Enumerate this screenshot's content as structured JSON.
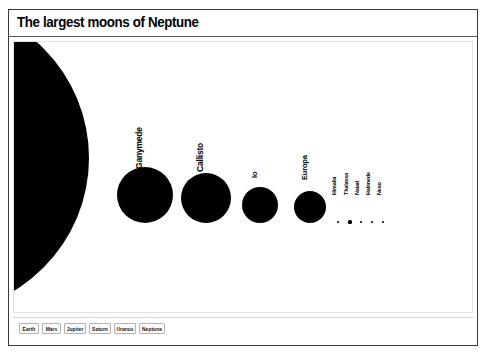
{
  "window": {
    "title": "The largest moons of Neptune"
  },
  "tabs": [
    {
      "label": "Earth",
      "x": 6,
      "w": 20
    },
    {
      "label": "Mars",
      "x": 29,
      "w": 19
    },
    {
      "label": "Jupiter",
      "x": 51,
      "w": 22
    },
    {
      "label": "Saturn",
      "x": 76,
      "w": 22
    },
    {
      "label": "Uranus",
      "x": 101,
      "w": 22
    },
    {
      "label": "Neptune",
      "x": 126,
      "w": 26
    }
  ],
  "chart_data": {
    "type": "scatter",
    "title": "The largest moons of Neptune",
    "xlabel": "",
    "ylabel": "",
    "grid": false,
    "legend": false,
    "baseline_y": 181,
    "encoding": "circle area scaled to body diameter",
    "categories": [
      "Neptune",
      "Ganymede",
      "Callisto",
      "Io",
      "Europa",
      "Himalia",
      "Thalassa",
      "Naiad",
      "Halimede",
      "Neso"
    ],
    "bodies": [
      {
        "name": "Neptune",
        "cx": -80,
        "cy": 116,
        "d": 310,
        "label": "",
        "label_x": 0,
        "label_y": 0,
        "fontsize": 0
      },
      {
        "name": "Ganymede",
        "cx": 131,
        "cy": 153,
        "d": 56,
        "label": "Ganymede",
        "label_x": 130,
        "label_y": 117,
        "fontsize": 8.5
      },
      {
        "name": "Callisto",
        "cx": 192,
        "cy": 156,
        "d": 50,
        "label": "Callisto",
        "label_x": 191,
        "label_y": 120,
        "fontsize": 8.5
      },
      {
        "name": "Io",
        "cx": 246,
        "cy": 163,
        "d": 36,
        "label": "Io",
        "label_x": 245,
        "label_y": 127,
        "fontsize": 7.5
      },
      {
        "name": "Europa",
        "cx": 296,
        "cy": 165,
        "d": 32,
        "label": "Europa",
        "label_x": 295,
        "label_y": 129,
        "fontsize": 7.5
      },
      {
        "name": "Himalia",
        "cx": 324,
        "cy": 180,
        "d": 2.0,
        "label": "Himalia",
        "label_x": 323,
        "label_y": 147,
        "fontsize": 5.5
      },
      {
        "name": "Thalassa",
        "cx": 336,
        "cy": 180,
        "d": 3.2,
        "label": "Thalassa",
        "label_x": 335,
        "label_y": 147,
        "fontsize": 5.5
      },
      {
        "name": "Naiad",
        "cx": 347,
        "cy": 180,
        "d": 2.6,
        "label": "Naiad",
        "label_x": 346,
        "label_y": 147,
        "fontsize": 5.5
      },
      {
        "name": "Halimede",
        "cx": 358,
        "cy": 180,
        "d": 2.4,
        "label": "Halimede",
        "label_x": 357,
        "label_y": 147,
        "fontsize": 5.5
      },
      {
        "name": "Neso",
        "cx": 369,
        "cy": 180,
        "d": 2.2,
        "label": "Neso",
        "label_x": 368,
        "label_y": 147,
        "fontsize": 5.5
      }
    ]
  }
}
